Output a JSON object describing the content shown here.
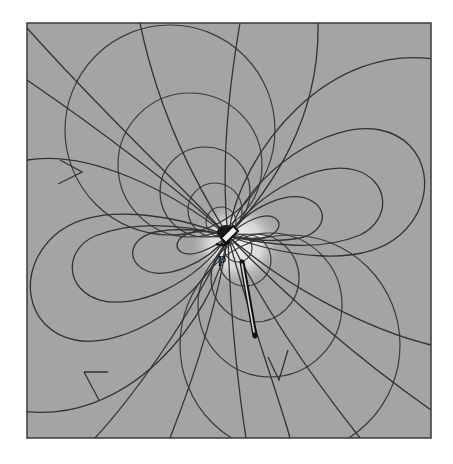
{
  "figure": {
    "type": "field-line diagram",
    "colors": {
      "background": "#a4a4a4",
      "lines": "#333333",
      "border": "#3a3a3a",
      "halo": "#e6e6e6",
      "rod": "#111111"
    },
    "frame": {
      "x": 27,
      "y": 23,
      "width": 404,
      "height": 415
    },
    "dipole": {
      "label": "p",
      "center_x": 228,
      "center_y": 236
    },
    "rod": {
      "x1": 244,
      "y1": 262,
      "x2": 258,
      "y2": 336
    },
    "arrows": [
      {
        "x": 78,
        "y": 172,
        "direction": "right"
      },
      {
        "x": 94,
        "y": 371,
        "direction": "right"
      },
      {
        "x": 279,
        "y": 370,
        "direction": "down"
      }
    ]
  }
}
